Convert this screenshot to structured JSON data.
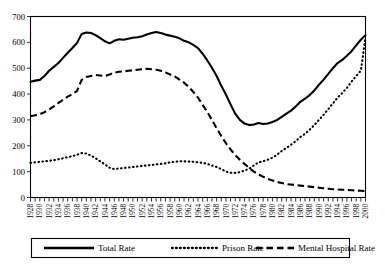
{
  "chart_data": {
    "type": "line",
    "title": "",
    "subtitle": "",
    "xlabel": "",
    "ylabel": "",
    "ylim": [
      0,
      700
    ],
    "ytick_step": 100,
    "ytick_labels": [
      "0",
      "100",
      "200",
      "300",
      "400",
      "500",
      "600",
      "700"
    ],
    "grid": true,
    "legend_position": "bottom",
    "xlim": [
      1928,
      2000
    ],
    "x": [
      1928,
      1929,
      1930,
      1931,
      1932,
      1933,
      1934,
      1935,
      1936,
      1937,
      1938,
      1939,
      1940,
      1941,
      1942,
      1943,
      1944,
      1945,
      1946,
      1947,
      1948,
      1949,
      1950,
      1951,
      1952,
      1953,
      1954,
      1955,
      1956,
      1957,
      1958,
      1959,
      1960,
      1961,
      1962,
      1963,
      1964,
      1965,
      1966,
      1967,
      1968,
      1969,
      1970,
      1971,
      1972,
      1973,
      1974,
      1975,
      1976,
      1977,
      1978,
      1979,
      1980,
      1981,
      1982,
      1983,
      1984,
      1985,
      1986,
      1987,
      1988,
      1989,
      1990,
      1991,
      1992,
      1993,
      1994,
      1995,
      1996,
      1997,
      1998,
      1999,
      2000
    ],
    "xtick_labels": [
      "1928",
      "1930",
      "1932",
      "1934",
      "1936",
      "1938",
      "1940",
      "1942",
      "1944",
      "1946",
      "1948",
      "1950",
      "1952",
      "1954",
      "1956",
      "1958",
      "1960",
      "1962",
      "1964",
      "1966",
      "1968",
      "1970",
      "1972",
      "1974",
      "1976",
      "1978",
      "1980",
      "1982",
      "1984",
      "1986",
      "1988",
      "1990",
      "1992",
      "1994",
      "1996",
      "1998",
      "2000"
    ],
    "xtick_label_step_years": 2,
    "series": [
      {
        "name": "Total Rate",
        "style": "solid",
        "values": [
          448,
          452,
          455,
          470,
          490,
          505,
          520,
          540,
          560,
          578,
          598,
          632,
          638,
          636,
          628,
          616,
          604,
          596,
          606,
          612,
          610,
          614,
          618,
          620,
          624,
          630,
          636,
          640,
          636,
          630,
          626,
          622,
          616,
          606,
          600,
          590,
          578,
          556,
          530,
          502,
          470,
          432,
          398,
          360,
          324,
          300,
          286,
          280,
          282,
          288,
          284,
          286,
          292,
          300,
          312,
          324,
          336,
          352,
          370,
          382,
          396,
          414,
          436,
          456,
          478,
          500,
          520,
          532,
          548,
          566,
          588,
          610,
          628
        ]
      },
      {
        "name": "Prison Rate",
        "style": "dotted",
        "values": [
          134,
          136,
          138,
          140,
          142,
          144,
          148,
          152,
          156,
          160,
          165,
          172,
          170,
          162,
          152,
          140,
          128,
          115,
          110,
          112,
          114,
          116,
          118,
          120,
          122,
          124,
          126,
          128,
          130,
          132,
          136,
          138,
          140,
          140,
          139,
          138,
          136,
          134,
          130,
          124,
          118,
          110,
          100,
          96,
          95,
          98,
          104,
          112,
          124,
          136,
          140,
          146,
          154,
          166,
          180,
          192,
          204,
          218,
          234,
          246,
          262,
          280,
          300,
          320,
          342,
          364,
          386,
          404,
          424,
          448,
          470,
          490,
          620
        ]
      },
      {
        "name": "Mental Hospital Rate",
        "style": "dashed",
        "values": [
          314,
          318,
          322,
          330,
          340,
          352,
          366,
          378,
          390,
          400,
          412,
          455,
          466,
          470,
          474,
          472,
          470,
          476,
          482,
          486,
          488,
          490,
          492,
          494,
          496,
          498,
          496,
          494,
          490,
          484,
          476,
          468,
          456,
          444,
          428,
          408,
          386,
          358,
          330,
          300,
          268,
          238,
          210,
          186,
          164,
          146,
          130,
          114,
          100,
          90,
          80,
          72,
          66,
          60,
          56,
          52,
          50,
          48,
          46,
          44,
          42,
          40,
          38,
          36,
          34,
          32,
          31,
          30,
          29,
          28,
          27,
          26,
          25
        ]
      }
    ]
  },
  "legend": {
    "items": [
      {
        "label": "Total Rate",
        "style": "solid"
      },
      {
        "label": "Prison Rate",
        "style": "dotted"
      },
      {
        "label": "Mental Hospital Rate",
        "style": "dashed"
      }
    ]
  }
}
